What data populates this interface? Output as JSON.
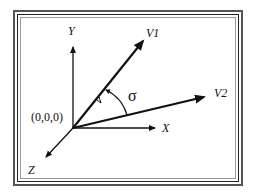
{
  "diagram": {
    "title": "",
    "axes": {
      "x_label": "X",
      "y_label": "Y",
      "z_label": "Z"
    },
    "origin_label": "(0,0,0)",
    "vectors": [
      {
        "name": "V1",
        "label": "V1"
      },
      {
        "name": "V2",
        "label": "V2"
      }
    ],
    "angle_label": "σ",
    "colors": {
      "line": "#111111",
      "frame": "#444444",
      "background": "#ffffff"
    }
  }
}
